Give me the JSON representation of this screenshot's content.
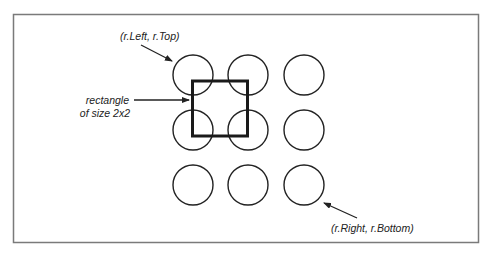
{
  "diagram": {
    "frame": {
      "x": 13,
      "y": 14,
      "width": 465,
      "height": 228,
      "color": "#7a7a7a"
    },
    "grid": {
      "rows": 3,
      "cols": 3,
      "col_centers": [
        193,
        248,
        304
      ],
      "row_centers": [
        75,
        130,
        185
      ],
      "radius": 20,
      "stroke": "#222222"
    },
    "rectangle": {
      "x": 192,
      "y": 80,
      "width": 55,
      "height": 56,
      "stroke": "#1a1a1a",
      "stroke_width": 3,
      "size_label": "2x2"
    },
    "labels": {
      "top_left": "(r.Left, r.Top)",
      "rect_line1": "rectangle",
      "rect_line2": "of size 2x2",
      "bottom_right": "(r.Right, r.Bottom)"
    }
  }
}
